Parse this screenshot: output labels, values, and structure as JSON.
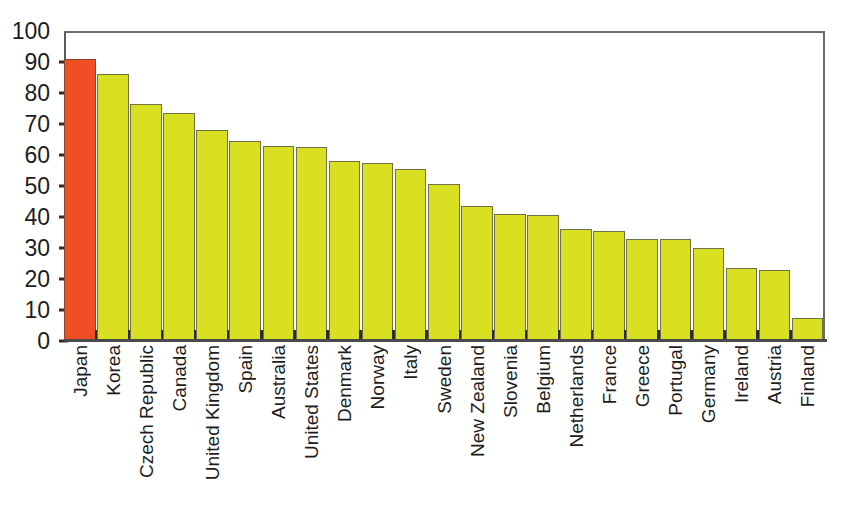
{
  "chart_data": {
    "type": "bar",
    "title": "",
    "xlabel": "",
    "ylabel": "",
    "ylim": [
      0,
      100
    ],
    "yticks": [
      0,
      10,
      20,
      30,
      40,
      50,
      60,
      70,
      80,
      90,
      100
    ],
    "grid": false,
    "legend": "none",
    "orientation": "vertical",
    "categories": [
      "Japan",
      "Korea",
      "Czech Republic",
      "Canada",
      "United Kingdom",
      "Spain",
      "Australia",
      "United States",
      "Denmark",
      "Norway",
      "Italy",
      "Sweden",
      "New Zealand",
      "Slovenia",
      "Belgium",
      "Netherlands",
      "France",
      "Greece",
      "Portugal",
      "Germany",
      "Ireland",
      "Austria",
      "Finland"
    ],
    "values": [
      91,
      86,
      76.5,
      73.5,
      68,
      64.5,
      63,
      62.5,
      58,
      57.5,
      55.5,
      50.5,
      43.5,
      41,
      40.5,
      36,
      35.5,
      33,
      33,
      30,
      23.5,
      23,
      7.5
    ],
    "highlight_index": 0,
    "colors": {
      "highlight": "#F04F25",
      "default": "#D9E021",
      "bar_outline": "#6F6F4A",
      "highlight_outline": "#8A4A2A",
      "axis": "#4A4A4A",
      "frame": "#5D5D5D",
      "text": "#1D1D1D",
      "background": "#FFFFFF"
    }
  }
}
